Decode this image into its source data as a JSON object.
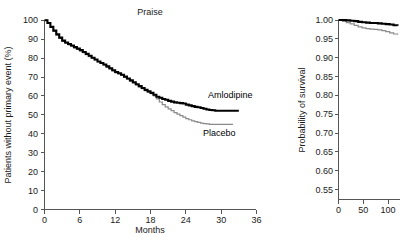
{
  "figure": {
    "background": "#ffffff",
    "text_color": "#1a1a1a",
    "axis_color": "#555555"
  },
  "chart_data": [
    {
      "id": "praise-primary-event",
      "type": "line",
      "title": "Praise",
      "xlabel": "Months",
      "ylabel": "Patients without primary event (%)",
      "xlim": [
        0,
        36
      ],
      "ylim": [
        0,
        100
      ],
      "xticks": [
        0,
        6,
        12,
        18,
        24,
        30,
        36
      ],
      "xticklabels": [
        "0",
        "6",
        "12",
        "18",
        "24",
        "30",
        "36"
      ],
      "yticks": [
        0,
        10,
        20,
        30,
        40,
        50,
        60,
        70,
        80,
        90,
        100
      ],
      "yticklabels": [
        "0",
        "10",
        "20",
        "30",
        "40",
        "50",
        "60",
        "70",
        "80",
        "90",
        "100"
      ],
      "grid": false,
      "legend_position": "inline-annotation",
      "series": [
        {
          "name": "Amlodipine",
          "color": "#000000",
          "linewidth": 2.1,
          "label_text": "Amlodipine",
          "x": [
            0,
            0.5,
            1,
            1.5,
            2,
            2.5,
            3,
            3.5,
            4,
            4.5,
            5,
            5.5,
            6,
            6.5,
            7,
            7.5,
            8,
            8.5,
            9,
            9.5,
            10,
            10.5,
            11,
            11.5,
            12,
            12.5,
            13,
            13.5,
            14,
            14.5,
            15,
            15.5,
            16,
            16.5,
            17,
            17.5,
            18,
            18.5,
            19,
            19.5,
            20,
            20.5,
            21,
            21.5,
            22,
            22.5,
            23,
            23.5,
            24,
            24.5,
            25,
            25.5,
            26,
            26.5,
            27,
            27.5,
            28,
            28.5,
            29,
            29.5,
            30,
            31,
            32,
            33
          ],
          "y": [
            100,
            98.5,
            96.5,
            94.5,
            92.5,
            90.8,
            89.2,
            88.2,
            87.4,
            86.6,
            85.8,
            85.0,
            84.2,
            83.2,
            82.2,
            81.2,
            80.2,
            79.2,
            78.2,
            77.4,
            76.6,
            75.6,
            74.6,
            73.6,
            72.6,
            72.0,
            71.2,
            70.2,
            69.2,
            68.2,
            67.2,
            66.2,
            65.2,
            64.2,
            63.2,
            62.4,
            61.6,
            60.6,
            59.6,
            59.0,
            58.4,
            58.0,
            57.4,
            57.0,
            56.6,
            56.4,
            56.2,
            56.0,
            55.4,
            55.0,
            54.6,
            54.2,
            54.0,
            53.6,
            53.2,
            52.8,
            52.6,
            52.4,
            52.2,
            52.2,
            52.2,
            52.2,
            52.2,
            52.2
          ]
        },
        {
          "name": "Placebo",
          "color": "#8a8a8a",
          "linewidth": 1.2,
          "label_text": "Placebo",
          "x": [
            0,
            0.5,
            1,
            1.5,
            2,
            2.5,
            3,
            3.5,
            4,
            4.5,
            5,
            5.5,
            6,
            6.5,
            7,
            7.5,
            8,
            8.5,
            9,
            9.5,
            10,
            10.5,
            11,
            11.5,
            12,
            12.5,
            13,
            13.5,
            14,
            14.5,
            15,
            15.5,
            16,
            16.5,
            17,
            17.5,
            18,
            18.5,
            19,
            19.5,
            20,
            20.5,
            21,
            21.5,
            22,
            22.5,
            23,
            23.5,
            24,
            24.5,
            25,
            25.5,
            26,
            26.5,
            27,
            27.5,
            28,
            28.5,
            29,
            29.5,
            30,
            31,
            32
          ],
          "y": [
            100,
            98.3,
            96.2,
            94.2,
            92.2,
            90.4,
            88.8,
            87.8,
            87.0,
            86.2,
            85.4,
            84.6,
            83.8,
            82.8,
            81.8,
            80.8,
            80.0,
            79.0,
            78.0,
            77.2,
            76.2,
            75.2,
            74.2,
            73.2,
            72.2,
            71.6,
            70.8,
            69.8,
            68.8,
            67.8,
            66.8,
            65.8,
            64.8,
            63.8,
            62.8,
            62.0,
            61.2,
            60.0,
            58.4,
            56.8,
            55.4,
            54.2,
            53.2,
            52.2,
            51.2,
            50.4,
            49.6,
            48.8,
            48.0,
            47.4,
            46.8,
            46.4,
            46.0,
            45.6,
            45.4,
            45.2,
            45.0,
            45.0,
            45.0,
            45.0,
            45.0,
            45.0,
            45.0
          ]
        }
      ]
    },
    {
      "id": "probability-of-survival",
      "type": "line",
      "title": "",
      "xlabel": "",
      "ylabel": "Probability of survival",
      "xlim": [
        0,
        125
      ],
      "ylim": [
        0.525,
        1.0
      ],
      "xticks": [
        0,
        50,
        100
      ],
      "xticklabels": [
        "0",
        "50",
        "100"
      ],
      "yticks": [
        0.55,
        0.6,
        0.65,
        0.7,
        0.75,
        0.8,
        0.85,
        0.9,
        0.95,
        1.0
      ],
      "yticklabels": [
        "0.55",
        "0.60",
        "0.65",
        "0.70",
        "0.75",
        "0.80",
        "0.85",
        "0.90",
        "0.95",
        "1.00"
      ],
      "grid": false,
      "legend_position": "none",
      "series": [
        {
          "name": "Amlodipine",
          "color": "#000000",
          "linewidth": 2.1,
          "x": [
            0,
            8,
            16,
            24,
            32,
            40,
            48,
            56,
            64,
            72,
            80,
            88,
            96,
            104,
            112,
            120
          ],
          "y": [
            1.0,
            1.0,
            0.999,
            0.998,
            0.997,
            0.995,
            0.994,
            0.993,
            0.992,
            0.992,
            0.991,
            0.99,
            0.989,
            0.988,
            0.986,
            0.985
          ]
        },
        {
          "name": "Placebo",
          "color": "#8a8a8a",
          "linewidth": 1.2,
          "x": [
            0,
            8,
            16,
            24,
            32,
            40,
            48,
            56,
            64,
            72,
            80,
            88,
            96,
            104,
            112,
            120
          ],
          "y": [
            1.0,
            0.996,
            0.993,
            0.99,
            0.986,
            0.982,
            0.979,
            0.977,
            0.976,
            0.975,
            0.974,
            0.972,
            0.969,
            0.966,
            0.963,
            0.961
          ]
        }
      ]
    }
  ]
}
